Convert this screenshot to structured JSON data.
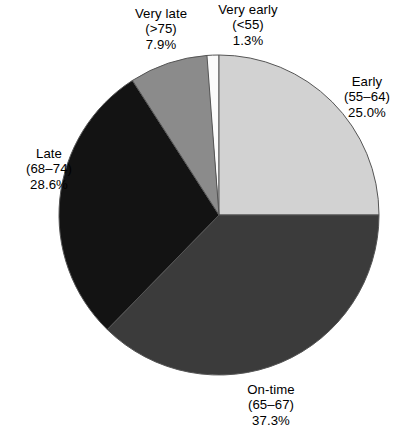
{
  "chart_data": {
    "type": "pie",
    "title": "",
    "subtitle": "",
    "xlabel": "",
    "ylabel": "",
    "legend_position": "labels-around-pie",
    "grid": false,
    "start_angle_deg_from_top": -4.68,
    "direction": "clockwise",
    "center": {
      "x": 219,
      "y": 215
    },
    "radius": 160,
    "categories": [
      "Very early (<55)",
      "Early (55–64)",
      "On-time (65–67)",
      "Late (68–74)",
      "Very late (>75)"
    ],
    "values": [
      1.3,
      25.0,
      37.3,
      28.6,
      7.9
    ],
    "units": "percent",
    "slices": [
      {
        "name": "very-early",
        "label_name": "Very early",
        "label_range": "(<55)",
        "label_value": "1.3%",
        "value": 1.3,
        "color": "#fbfbfb",
        "stroke": "#555555",
        "start_deg": -4.68,
        "sweep_deg": 4.68
      },
      {
        "name": "early",
        "label_name": "Early",
        "label_range": "(55–64)",
        "label_value": "25.0%",
        "value": 25.0,
        "color": "#d2d2d2",
        "stroke": "#555555",
        "start_deg": 0,
        "sweep_deg": 90.0
      },
      {
        "name": "on-time",
        "label_name": "On-time",
        "label_range": "(65–67)",
        "label_value": "37.3%",
        "value": 37.3,
        "color": "#3b3b3b",
        "stroke": "#555555",
        "start_deg": 90.0,
        "sweep_deg": 134.28
      },
      {
        "name": "late",
        "label_name": "Late",
        "label_range": "(68–74)",
        "label_value": "28.6%",
        "value": 28.6,
        "color": "#131313",
        "stroke": "#555555",
        "start_deg": 224.28,
        "sweep_deg": 102.96
      },
      {
        "name": "very-late",
        "label_name": "Very late",
        "label_range": "(>75)",
        "label_value": "7.9%",
        "value": 7.9,
        "color": "#8b8b8b",
        "stroke": "#555555",
        "start_deg": 327.24,
        "sweep_deg": 28.44
      }
    ]
  },
  "labels": {
    "very_late": {
      "name": "Very late",
      "range": "(>75)",
      "value": "7.9%"
    },
    "very_early": {
      "name": "Very early",
      "range": "(<55)",
      "value": "1.3%"
    },
    "early": {
      "name": "Early",
      "range": "(55–64)",
      "value": "25.0%"
    },
    "late": {
      "name": "Late",
      "range": "(68–74)",
      "value": "28.6%"
    },
    "on_time": {
      "name": "On-time",
      "range": "(65–67)",
      "value": "37.3%"
    }
  },
  "colors": {
    "background": "#ffffff",
    "text": "#000000",
    "slice_outline": "#555555",
    "very_early": "#fbfbfb",
    "early": "#d2d2d2",
    "on_time": "#3b3b3b",
    "late": "#131313",
    "very_late": "#8b8b8b"
  }
}
